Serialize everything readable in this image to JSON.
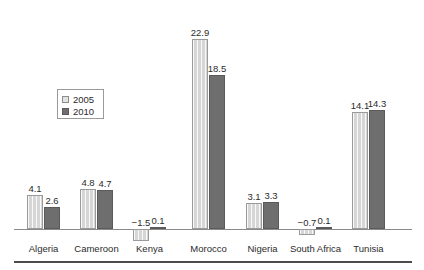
{
  "chart_data": {
    "type": "bar",
    "title": "",
    "subtitle": "",
    "xlabel": "",
    "ylabel": "",
    "grid": false,
    "legend_position": "inside-left",
    "baseline": 0,
    "ylim": [
      -2.5,
      24
    ],
    "categories": [
      "Algeria",
      "Cameroon",
      "Kenya",
      "Morocco",
      "Nigeria",
      "South Africa",
      "Tunisia"
    ],
    "series": [
      {
        "name": "2005",
        "color": "#d6d6d6",
        "values": [
          4.1,
          4.8,
          -1.5,
          22.9,
          3.1,
          -0.7,
          14.1
        ],
        "labels": [
          "4.1",
          "4.8",
          "−1.5",
          "22.9",
          "3.1",
          "−0.7",
          "14.1"
        ]
      },
      {
        "name": "2010",
        "color": "#6e6e6e",
        "values": [
          2.6,
          4.7,
          0.1,
          18.5,
          3.3,
          0.1,
          14.3
        ],
        "labels": [
          "2.6",
          "4.7",
          "0.1",
          "18.5",
          "3.3",
          "0.1",
          "14.3"
        ]
      }
    ]
  },
  "legend": {
    "entries": [
      {
        "label": "2005",
        "swatch": "light-square-swatch"
      },
      {
        "label": "2010",
        "swatch": "dark-square-swatch"
      }
    ]
  },
  "colors": {
    "series_2005": "#d6d6d6",
    "series_2010": "#6e6e6e",
    "axis": "#8a8a8a",
    "rule": "#4c4c4c",
    "text": "#2b2b2b"
  }
}
